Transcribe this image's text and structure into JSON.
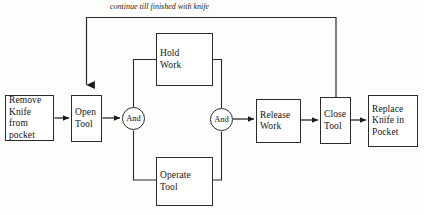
{
  "diagram": {
    "background_color": "#fdfdfc",
    "line_color": "#2b2b2b",
    "text_color": "#141414",
    "loop_caption": "continue till finished with knife",
    "nodes": [
      {
        "id": "remove-knife",
        "label": "Remove\nKnife from\npocket",
        "shape": "rect",
        "x": 5,
        "y": 95,
        "w": 49,
        "h": 46
      },
      {
        "id": "open-tool",
        "label": "Open\nTool",
        "shape": "rect",
        "x": 71,
        "y": 95,
        "w": 31,
        "h": 47
      },
      {
        "id": "and-gate-1",
        "label": "And",
        "shape": "circle",
        "x": 122,
        "y": 107,
        "w": 23,
        "h": 23
      },
      {
        "id": "hold-work",
        "label": "Hold\nWork",
        "shape": "rect",
        "x": 156,
        "y": 33,
        "w": 57,
        "h": 53
      },
      {
        "id": "operate-tool",
        "label": "Operate\nTool",
        "shape": "rect",
        "x": 156,
        "y": 157,
        "w": 57,
        "h": 49
      },
      {
        "id": "and-gate-2",
        "label": "And",
        "shape": "circle",
        "x": 210,
        "y": 108,
        "w": 23,
        "h": 23
      },
      {
        "id": "release-work",
        "label": "Release\nWork",
        "shape": "rect",
        "x": 256,
        "y": 99,
        "w": 45,
        "h": 44
      },
      {
        "id": "close-tool",
        "label": "Close\nTool",
        "shape": "rect",
        "x": 320,
        "y": 97,
        "w": 31,
        "h": 47
      },
      {
        "id": "replace-knife",
        "label": "Replace\nKnife in\nPocket",
        "shape": "rect",
        "x": 368,
        "y": 95,
        "w": 50,
        "h": 52
      }
    ],
    "edges": [
      {
        "from": "remove-knife",
        "to": "open-tool",
        "arrow": true
      },
      {
        "from": "open-tool",
        "to": "and-gate-1",
        "arrow": true
      },
      {
        "from": "and-gate-1",
        "to": "hold-work",
        "arrow": false
      },
      {
        "from": "and-gate-1",
        "to": "operate-tool",
        "arrow": false
      },
      {
        "from": "hold-work",
        "to": "and-gate-2",
        "arrow": false
      },
      {
        "from": "operate-tool",
        "to": "and-gate-2",
        "arrow": false
      },
      {
        "from": "and-gate-2",
        "to": "release-work",
        "arrow": true
      },
      {
        "from": "release-work",
        "to": "close-tool",
        "arrow": true
      },
      {
        "from": "close-tool",
        "to": "replace-knife",
        "arrow": true
      },
      {
        "from": "close-tool",
        "to": "open-tool",
        "arrow": true,
        "label": "continue till finished with knife",
        "style": "feedback-loop"
      }
    ]
  }
}
